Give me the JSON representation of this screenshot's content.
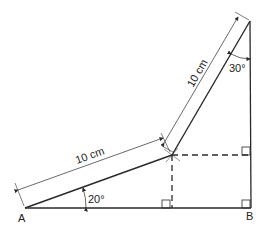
{
  "diagram": {
    "points": {
      "A": {
        "label": "A",
        "x": 25,
        "y": 208
      },
      "B": {
        "label": "B",
        "x": 251,
        "y": 208
      },
      "J": {
        "x": 172,
        "y": 155
      },
      "T": {
        "x": 250,
        "y": 21
      }
    },
    "segments": [
      {
        "from": "A",
        "to": "J",
        "length_label": "10 cm"
      },
      {
        "from": "J",
        "to": "T",
        "length_label": "10 cm"
      }
    ],
    "angles": {
      "at_A": "20°",
      "at_top": "30°"
    },
    "colors": {
      "stroke": "#2a2a2a",
      "text": "#222222",
      "background": "#ffffff"
    }
  }
}
